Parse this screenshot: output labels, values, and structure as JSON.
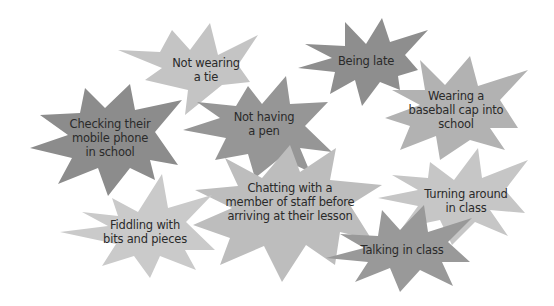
{
  "diagram": {
    "type": "star-burst cluster",
    "background": "#ffffff",
    "stars": [
      {
        "id": "not-wearing-a-tie",
        "label": "Not wearing\na tie",
        "fill": "#c4c4c4",
        "label_pos": [
          206,
          70
        ],
        "points": [
          [
            210,
            23
          ],
          [
            218,
            55
          ],
          [
            258,
            35
          ],
          [
            238,
            65
          ],
          [
            250,
            82
          ],
          [
            222,
            85
          ],
          [
            185,
            115
          ],
          [
            188,
            90
          ],
          [
            145,
            80
          ],
          [
            162,
            68
          ],
          [
            118,
            50
          ],
          [
            160,
            52
          ],
          [
            172,
            30
          ],
          [
            190,
            50
          ]
        ]
      },
      {
        "id": "checking-mobile-phone",
        "label": "Checking their\nmobile phone\nin school",
        "fill": "#8c8c8c",
        "label_pos": [
          110,
          138
        ],
        "points": [
          [
            85,
            88
          ],
          [
            105,
            108
          ],
          [
            130,
            84
          ],
          [
            135,
            110
          ],
          [
            182,
            100
          ],
          [
            155,
            132
          ],
          [
            178,
            165
          ],
          [
            150,
            160
          ],
          [
            155,
            180
          ],
          [
            130,
            168
          ],
          [
            108,
            196
          ],
          [
            98,
            168
          ],
          [
            58,
            184
          ],
          [
            72,
            158
          ],
          [
            30,
            148
          ],
          [
            68,
            135
          ],
          [
            40,
            115
          ],
          [
            80,
            113
          ]
        ]
      },
      {
        "id": "being-late",
        "label": "Being late",
        "fill": "#8e8e8e",
        "label_pos": [
          366,
          61
        ],
        "points": [
          [
            345,
            22
          ],
          [
            366,
            44
          ],
          [
            382,
            18
          ],
          [
            390,
            42
          ],
          [
            428,
            30
          ],
          [
            405,
            55
          ],
          [
            418,
            70
          ],
          [
            398,
            76
          ],
          [
            400,
            90
          ],
          [
            380,
            82
          ],
          [
            362,
            106
          ],
          [
            355,
            80
          ],
          [
            330,
            94
          ],
          [
            335,
            72
          ],
          [
            298,
            68
          ],
          [
            332,
            58
          ],
          [
            305,
            44
          ],
          [
            345,
            46
          ]
        ]
      },
      {
        "id": "not-having-a-pen",
        "label": "Not having\na pen",
        "fill": "#969696",
        "label_pos": [
          264,
          124
        ],
        "points": [
          [
            248,
            86
          ],
          [
            262,
            104
          ],
          [
            286,
            76
          ],
          [
            290,
            104
          ],
          [
            328,
            102
          ],
          [
            305,
            126
          ],
          [
            332,
            152
          ],
          [
            300,
            148
          ],
          [
            310,
            172
          ],
          [
            280,
            158
          ],
          [
            255,
            178
          ],
          [
            248,
            154
          ],
          [
            215,
            160
          ],
          [
            226,
            138
          ],
          [
            183,
            130
          ],
          [
            220,
            118
          ],
          [
            197,
            102
          ],
          [
            236,
            106
          ]
        ]
      },
      {
        "id": "wearing-baseball-cap",
        "label": "Wearing a\nbaseball cap into\nschool",
        "fill": "#b2b2b2",
        "label_pos": [
          456,
          110
        ],
        "points": [
          [
            420,
            60
          ],
          [
            445,
            85
          ],
          [
            470,
            56
          ],
          [
            478,
            86
          ],
          [
            528,
            70
          ],
          [
            500,
            100
          ],
          [
            518,
            128
          ],
          [
            490,
            128
          ],
          [
            505,
            150
          ],
          [
            470,
            140
          ],
          [
            440,
            160
          ],
          [
            436,
            136
          ],
          [
            400,
            150
          ],
          [
            410,
            126
          ],
          [
            385,
            118
          ],
          [
            420,
            105
          ],
          [
            392,
            90
          ],
          [
            425,
            90
          ]
        ]
      },
      {
        "id": "chatting-with-staff",
        "label": "Chatting with a\nmember of staff before\narriving at their lesson",
        "fill": "#bdbdbd",
        "label_pos": [
          290,
          202
        ],
        "points": [
          [
            225,
            158
          ],
          [
            262,
            178
          ],
          [
            290,
            145
          ],
          [
            300,
            172
          ],
          [
            336,
            148
          ],
          [
            330,
            180
          ],
          [
            382,
            185
          ],
          [
            350,
            205
          ],
          [
            372,
            240
          ],
          [
            340,
            232
          ],
          [
            335,
            265
          ],
          [
            306,
            245
          ],
          [
            282,
            282
          ],
          [
            264,
            246
          ],
          [
            220,
            265
          ],
          [
            230,
            238
          ],
          [
            193,
            225
          ],
          [
            232,
            208
          ],
          [
            195,
            190
          ],
          [
            238,
            186
          ]
        ]
      },
      {
        "id": "fiddling-with-bits",
        "label": "Fiddling with\nbits and pieces",
        "fill": "#cacaca",
        "label_pos": [
          145,
          232
        ],
        "points": [
          [
            112,
            198
          ],
          [
            138,
            212
          ],
          [
            162,
            174
          ],
          [
            168,
            208
          ],
          [
            212,
            195
          ],
          [
            186,
            222
          ],
          [
            215,
            250
          ],
          [
            185,
            250
          ],
          [
            196,
            270
          ],
          [
            160,
            256
          ],
          [
            150,
            278
          ],
          [
            134,
            256
          ],
          [
            102,
            266
          ],
          [
            116,
            244
          ],
          [
            60,
            232
          ],
          [
            108,
            226
          ],
          [
            82,
            212
          ],
          [
            118,
            216
          ]
        ]
      },
      {
        "id": "turning-around",
        "label": "Turning around\nin class",
        "fill": "#c6c6c6",
        "label_pos": [
          466,
          201
        ],
        "points": [
          [
            430,
            162
          ],
          [
            454,
            180
          ],
          [
            478,
            148
          ],
          [
            482,
            178
          ],
          [
            528,
            160
          ],
          [
            505,
            190
          ],
          [
            525,
            213
          ],
          [
            490,
            210
          ],
          [
            508,
            236
          ],
          [
            475,
            222
          ],
          [
            452,
            245
          ],
          [
            440,
            220
          ],
          [
            402,
            228
          ],
          [
            418,
            206
          ],
          [
            378,
            198
          ],
          [
            418,
            190
          ],
          [
            392,
            175
          ],
          [
            428,
            178
          ]
        ]
      },
      {
        "id": "talking-in-class",
        "label": "Talking in class",
        "fill": "#999999",
        "label_pos": [
          402,
          250
        ],
        "points": [
          [
            382,
            210
          ],
          [
            400,
            230
          ],
          [
            424,
            205
          ],
          [
            428,
            232
          ],
          [
            472,
            218
          ],
          [
            448,
            242
          ],
          [
            470,
            262
          ],
          [
            442,
            262
          ],
          [
            453,
            286
          ],
          [
            420,
            270
          ],
          [
            400,
            292
          ],
          [
            390,
            268
          ],
          [
            355,
            282
          ],
          [
            368,
            262
          ],
          [
            326,
            258
          ],
          [
            364,
            248
          ],
          [
            340,
            234
          ],
          [
            378,
            236
          ]
        ]
      }
    ]
  }
}
